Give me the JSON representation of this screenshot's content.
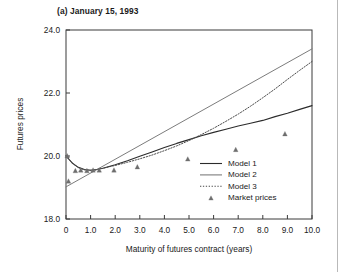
{
  "figure": {
    "title": "(a) January 15, 1993",
    "background": "#ffffff"
  },
  "chart_data": {
    "type": "line",
    "title": "(a) January 15, 1993",
    "xlabel": "Maturity of futures contract (years)",
    "ylabel": "Futures prices",
    "xlim": [
      0,
      10
    ],
    "ylim": [
      18.0,
      24.0
    ],
    "grid": false,
    "legend_position": "lower-right-inside",
    "xticks": [
      0,
      1,
      2,
      3,
      4,
      5,
      6,
      7,
      8,
      9,
      10
    ],
    "xtick_labels": [
      "0",
      "1.0",
      "2.0",
      "3.0",
      "4.0",
      "5.0",
      "6.0",
      "7.0",
      "8.0",
      "9.0",
      "10.0"
    ],
    "yticks": [
      18.0,
      20.0,
      22.0,
      24.0
    ],
    "ytick_labels": [
      "18.0",
      "20.0",
      "22.0",
      "24.0"
    ],
    "series": [
      {
        "name": "Model 1",
        "style": "solid",
        "color": "#2b2b2b",
        "width": 1.1,
        "x": [
          0.0,
          0.25,
          0.5,
          0.75,
          1.0,
          1.25,
          1.5,
          2.0,
          2.5,
          3.0,
          3.5,
          4.0,
          4.5,
          5.0,
          5.5,
          6.0,
          6.5,
          7.0,
          7.5,
          8.0,
          8.5,
          9.0,
          9.5,
          10.0
        ],
        "y": [
          20.0,
          19.78,
          19.64,
          19.57,
          19.55,
          19.57,
          19.61,
          19.72,
          19.85,
          19.99,
          20.13,
          20.27,
          20.4,
          20.52,
          20.64,
          20.75,
          20.85,
          20.95,
          21.04,
          21.13,
          21.25,
          21.36,
          21.48,
          21.6
        ]
      },
      {
        "name": "Model 2",
        "style": "solid",
        "color": "#7c7c7c",
        "width": 1.0,
        "x": [
          0.0,
          10.0
        ],
        "y": [
          19.02,
          23.4
        ]
      },
      {
        "name": "Model 3",
        "style": "dotted",
        "color": "#4a4a4a",
        "width": 1.0,
        "x": [
          0.0,
          0.25,
          0.5,
          0.75,
          1.0,
          1.25,
          1.5,
          2.0,
          2.5,
          3.0,
          3.5,
          4.0,
          4.5,
          5.0,
          5.5,
          6.0,
          6.5,
          7.0,
          7.5,
          8.0,
          8.5,
          9.0,
          9.5,
          10.0
        ],
        "y": [
          20.0,
          19.78,
          19.63,
          19.56,
          19.55,
          19.57,
          19.61,
          19.7,
          19.8,
          19.91,
          20.03,
          20.17,
          20.32,
          20.49,
          20.68,
          20.88,
          21.1,
          21.33,
          21.58,
          21.85,
          22.13,
          22.43,
          22.72,
          23.0
        ]
      },
      {
        "name": "Market prices",
        "style": "markers",
        "marker": "triangle",
        "color": "#6e6e6e",
        "x": [
          0.05,
          0.1,
          0.38,
          0.6,
          0.85,
          1.1,
          1.35,
          1.95,
          2.9,
          4.95,
          6.9,
          8.9
        ],
        "y": [
          20.0,
          19.2,
          19.53,
          19.55,
          19.53,
          19.55,
          19.55,
          19.55,
          19.65,
          19.9,
          20.2,
          20.7
        ]
      }
    ]
  },
  "axes": {
    "x": {
      "title": "Maturity of futures contract (years)",
      "tick_labels": [
        "0",
        "1.0",
        "2.0",
        "3.0",
        "4.0",
        "5.0",
        "6.0",
        "7.0",
        "8.0",
        "9.0",
        "10.0"
      ]
    },
    "y": {
      "title": "Futures prices",
      "tick_labels": [
        "18.0",
        "20.0",
        "22.0",
        "24.0"
      ]
    }
  },
  "legend": {
    "items": [
      {
        "label": "Model 1",
        "style": "solid",
        "color": "#2b2b2b"
      },
      {
        "label": "Model 2",
        "style": "solid",
        "color": "#7c7c7c"
      },
      {
        "label": "Model 3",
        "style": "dotted",
        "color": "#4a4a4a"
      },
      {
        "label": "Market prices",
        "style": "marker",
        "color": "#6e6e6e"
      }
    ]
  },
  "colors": {
    "frame": "#3a3a3a",
    "text": "#1a1a1a",
    "model1": "#2b2b2b",
    "model2": "#7c7c7c",
    "model3": "#4a4a4a",
    "market": "#6e6e6e"
  }
}
